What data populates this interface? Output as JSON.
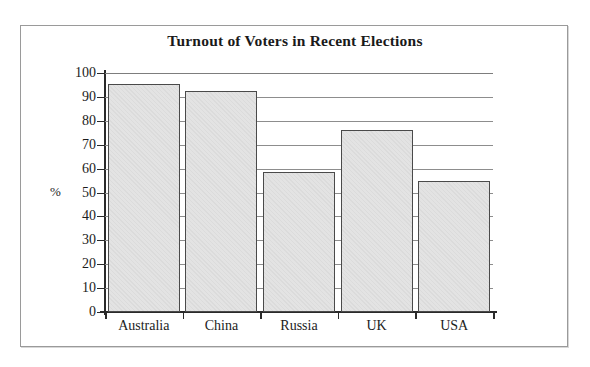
{
  "chart_data": {
    "type": "bar",
    "title": "Turnout of Voters in Recent Elections",
    "xlabel": "",
    "ylabel": "%",
    "categories": [
      "Australia",
      "China",
      "Russia",
      "UK",
      "USA"
    ],
    "values": [
      95.5,
      92.5,
      58.5,
      76,
      55
    ],
    "ylim": [
      0,
      100
    ],
    "ytick_labels": [
      "100",
      "90",
      "80",
      "70",
      "60",
      "50",
      "40",
      "30",
      "20",
      "10",
      "0"
    ],
    "ytick_values": [
      100,
      90,
      80,
      70,
      60,
      50,
      40,
      30,
      20,
      10,
      0
    ],
    "grid": true,
    "legend": false,
    "series": [
      {
        "name": "Turnout",
        "values": [
          95.5,
          92.5,
          58.5,
          76,
          55
        ]
      }
    ],
    "colors": {
      "bar_fill": "#e3e3e3",
      "bar_edge": "#4a4a4a",
      "axis": "#2a2a2a",
      "grid": "#8d8d8d",
      "text": "#1c1c1c",
      "frame": "#9a9a9a",
      "background": "#ffffff"
    }
  }
}
